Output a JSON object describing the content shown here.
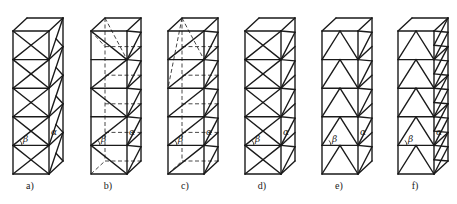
{
  "figure": {
    "panels": [
      {
        "id": "a",
        "label": "a)",
        "front_pattern": "diamond-cross",
        "side_pattern": "single-diagonal-continuous",
        "hidden_lines": false
      },
      {
        "id": "b",
        "label": "b)",
        "front_pattern": "alternating-diagonal-zigzag",
        "side_pattern": "k-diagonal",
        "hidden_lines": true
      },
      {
        "id": "c",
        "label": "c)",
        "front_pattern": "single-diagonal",
        "side_pattern": "k-diagonal",
        "hidden_lines": true
      },
      {
        "id": "d",
        "label": "d)",
        "front_pattern": "x-cross",
        "side_pattern": "k-diagonal",
        "hidden_lines": false
      },
      {
        "id": "e",
        "label": "e)",
        "front_pattern": "inverted-v-chevron",
        "side_pattern": "k-diagonal",
        "hidden_lines": false
      },
      {
        "id": "f",
        "label": "f)",
        "front_pattern": "inverted-v-chevron",
        "side_pattern": "double-k-diagonal",
        "hidden_lines": false
      }
    ],
    "angle_labels": {
      "alpha": "α",
      "beta": "β"
    },
    "line_color": "#1a1a1a",
    "background": "#ffffff"
  }
}
